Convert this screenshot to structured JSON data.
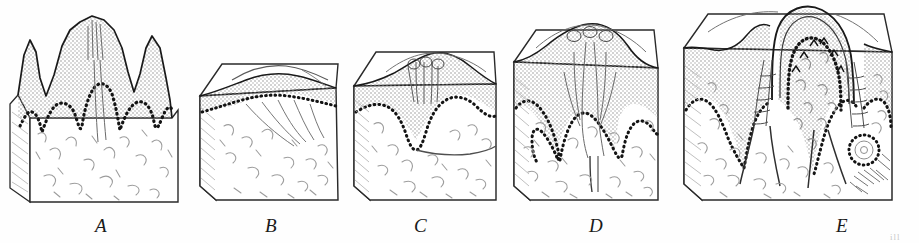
{
  "figure": {
    "kind": "anatomical-line-drawing",
    "background_color": "#fefefe",
    "ink_color": "#1a1a1a",
    "stipple_color": "#8a8a8a",
    "fiber_color": "#9a9a9a",
    "panel_count": 5
  },
  "panels": [
    {
      "id": "A",
      "label": "A",
      "label_x": 95,
      "label_y": 216,
      "name": "panel-a",
      "stage": "stage-1-folded-surface",
      "caption_text": "A",
      "box": {
        "x": 8,
        "y": 12,
        "w": 178,
        "h": 192
      }
    },
    {
      "id": "B",
      "label": "B",
      "label_x": 265,
      "label_y": 216,
      "name": "panel-b",
      "stage": "stage-2-flat-block",
      "caption_text": "B",
      "box": {
        "x": 196,
        "y": 58,
        "w": 142,
        "h": 146
      }
    },
    {
      "id": "C",
      "label": "C",
      "label_x": 414,
      "label_y": 216,
      "name": "panel-c",
      "stage": "stage-3-shallow-invagination",
      "caption_text": "C",
      "box": {
        "x": 348,
        "y": 44,
        "w": 148,
        "h": 160
      }
    },
    {
      "id": "D",
      "label": "D",
      "label_x": 589,
      "label_y": 216,
      "name": "panel-d",
      "stage": "stage-4-deepening-papilla",
      "caption_text": "D",
      "box": {
        "x": 508,
        "y": 24,
        "w": 160,
        "h": 180
      }
    },
    {
      "id": "E",
      "label": "E",
      "label_x": 836,
      "label_y": 216,
      "name": "panel-e",
      "stage": "stage-5-mature-papilla",
      "caption_text": "E",
      "box": {
        "x": 678,
        "y": 6,
        "w": 212,
        "h": 198
      }
    }
  ],
  "edge_artifact": {
    "text": "ill",
    "x": 890,
    "y": 232
  }
}
